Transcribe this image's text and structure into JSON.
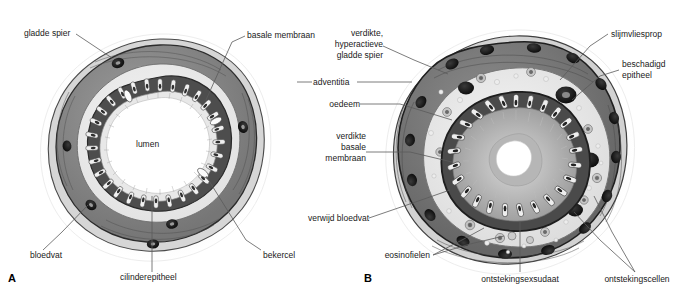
{
  "figure": {
    "colors": {
      "background": "#ffffff",
      "text": "#1a1a1a",
      "leader_line": "#4a4a4a",
      "outer_halo": "#f2f2f2",
      "adventitia": "#d9d9d9",
      "smooth_muscle": "#8c8c8c",
      "smooth_muscle_dark": "#6e6e6e",
      "submucosa": "#efefef",
      "epithelium": "#5a5a5a",
      "goblet_cell": "#f5f5f5",
      "blood_vessel": "#1c1c1c",
      "lumen": "#ffffff",
      "mucus_plug": "#b0b0b0",
      "inflammatory_cell": "#9a9a9a"
    }
  },
  "panels": [
    {
      "id": "A",
      "letter": "A",
      "name": "normale-bronchus",
      "labels": [
        {
          "key": "gladde-spier",
          "text": "gladde spier",
          "align": "left"
        },
        {
          "key": "basale-membraan",
          "text": "basale membraan",
          "align": "left"
        },
        {
          "key": "lumen",
          "text": "lumen",
          "align": "center"
        },
        {
          "key": "bloedvat",
          "text": "bloedvat",
          "align": "left"
        },
        {
          "key": "cilinderepitheel",
          "text": "cilinderepitheel",
          "align": "center"
        },
        {
          "key": "bekercel",
          "text": "bekercel",
          "align": "left"
        }
      ]
    },
    {
      "id": "B",
      "letter": "B",
      "name": "astmatische-bronchus",
      "labels": [
        {
          "key": "verdikte-hyperactieve-gladde-spier",
          "lines": [
            "verdikte,",
            "hyperactieve",
            "gladde spier"
          ],
          "align": "right"
        },
        {
          "key": "adventitia",
          "text": "adventitia",
          "align": "right"
        },
        {
          "key": "oedeem",
          "text": "oedeem",
          "align": "right"
        },
        {
          "key": "verdikte-basale-membraan",
          "lines": [
            "verdikte",
            "basale",
            "membraan"
          ],
          "align": "right"
        },
        {
          "key": "verwijd-bloedvat",
          "text": "verwijd bloedvat",
          "align": "right"
        },
        {
          "key": "eosinofielen",
          "text": "eosinofielen",
          "align": "right"
        },
        {
          "key": "slijmvliesprop",
          "text": "slijmvliesprop",
          "align": "left"
        },
        {
          "key": "beschadigd-epitheel",
          "lines": [
            "beschadigd",
            "epitheel"
          ],
          "align": "left"
        },
        {
          "key": "ontstekingsexsudaat",
          "text": "ontstekingsexsudaat",
          "align": "center"
        },
        {
          "key": "ontstekingscellen",
          "text": "ontstekingscellen",
          "align": "center"
        }
      ]
    }
  ],
  "labels_flat": {
    "gladde_spier": "gladde spier",
    "basale_membraan": "basale membraan",
    "lumen": "lumen",
    "bloedvat": "bloedvat",
    "cilinderepitheel": "cilinderepitheel",
    "bekercel": "bekercel",
    "verdikte": "verdikte,",
    "hyperactieve": "hyperactieve",
    "gladde_spier_b": "gladde spier",
    "adventitia": "adventitia",
    "oedeem": "oedeem",
    "verdikte_b": "verdikte",
    "basale_b": "basale",
    "membraan_b": "membraan",
    "verwijd_bloedvat": "verwijd bloedvat",
    "eosinofielen": "eosinofielen",
    "slijmvliesprop": "slijmvliesprop",
    "beschadigd": "beschadigd",
    "epitheel": "epitheel",
    "ontstekingsexsudaat": "ontstekingsexsudaat",
    "ontstekingscellen": "ontstekingscellen",
    "letter_a": "A",
    "letter_b": "B"
  }
}
